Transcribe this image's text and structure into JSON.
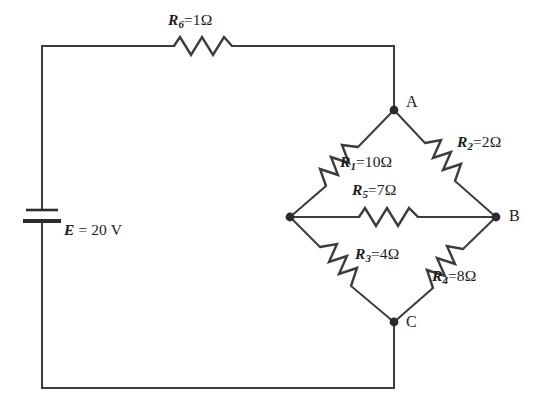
{
  "diagram": {
    "background_color": "#ffffff",
    "line_color": "#3b3b42",
    "source": {
      "symbol": "battery-cell",
      "label_var": "E",
      "label_eq": " = ",
      "label_value": "20",
      "label_unit": " V",
      "full_label": "E = 20 V"
    },
    "nodes": [
      {
        "id": "A",
        "label": "A",
        "x": 394,
        "y": 110
      },
      {
        "id": "B",
        "label": "B",
        "x": 496,
        "y": 217
      },
      {
        "id": "C",
        "label": "C",
        "x": 394,
        "y": 322
      },
      {
        "id": "D",
        "label": "",
        "x": 290,
        "y": 217
      }
    ],
    "resistors": [
      {
        "id": "R6",
        "var": "R",
        "sub": "6",
        "eq": "=",
        "value": "1",
        "unit": "Ω",
        "full_label": "R6 = 1Ω",
        "orientation": "horizontal",
        "position": "top-branch"
      },
      {
        "id": "R1",
        "var": "R",
        "sub": "1",
        "eq": "=",
        "value": "10",
        "unit": "Ω",
        "full_label": "R1 = 10Ω",
        "orientation": "diagonal",
        "position": "A-to-D"
      },
      {
        "id": "R2",
        "var": "R",
        "sub": "2",
        "eq": "=",
        "value": "2",
        "unit": "Ω",
        "full_label": "R2 = 2Ω",
        "orientation": "diagonal",
        "position": "A-to-B"
      },
      {
        "id": "R3",
        "var": "R",
        "sub": "3",
        "eq": "=",
        "value": "4",
        "unit": "Ω",
        "full_label": "R3 = 4Ω",
        "orientation": "diagonal",
        "position": "D-to-C"
      },
      {
        "id": "R4",
        "var": "R",
        "sub": "4",
        "eq": "=",
        "value": "8",
        "unit": "Ω",
        "full_label": "R4 = 8Ω",
        "orientation": "diagonal",
        "position": "B-to-C"
      },
      {
        "id": "R5",
        "var": "R",
        "sub": "5",
        "eq": "=",
        "value": "7",
        "unit": "Ω",
        "full_label": "R5 = 7Ω",
        "orientation": "horizontal",
        "position": "D-to-B-bridge"
      }
    ]
  }
}
